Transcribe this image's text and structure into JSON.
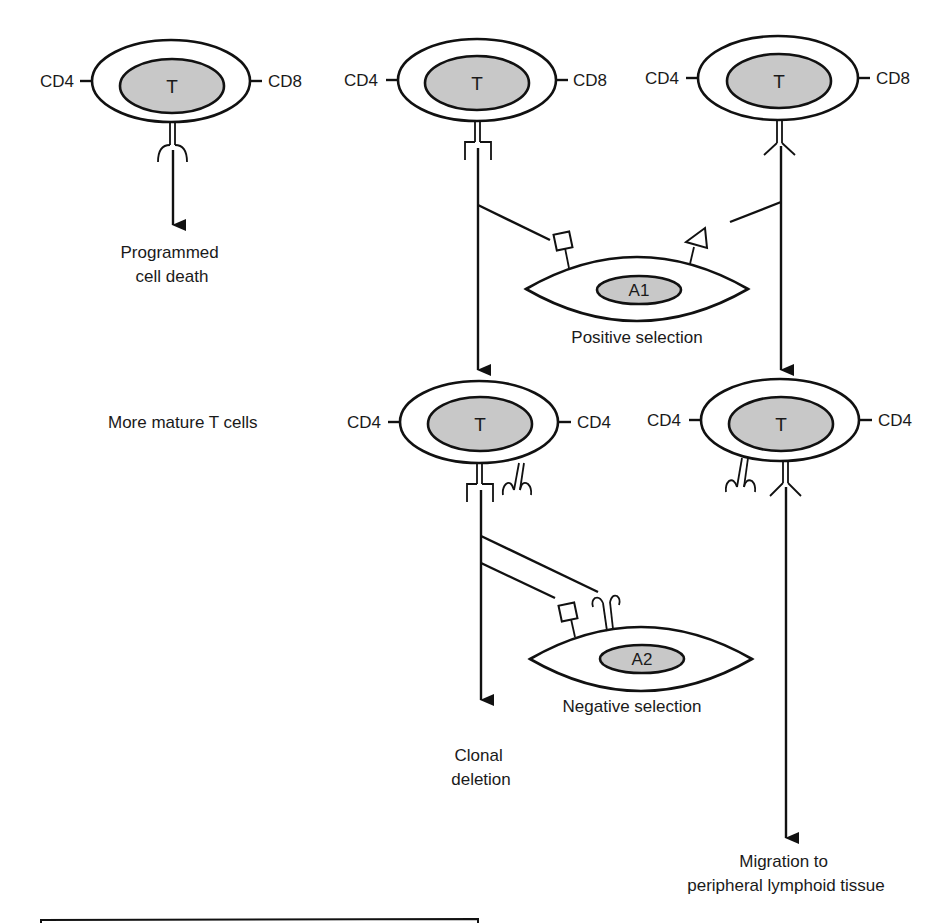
{
  "diagram": {
    "cells": {
      "immature_left": {
        "nucleus": "T",
        "marker_left": "CD4",
        "marker_right": "CD8",
        "fate": [
          "Programmed",
          "cell death"
        ]
      },
      "immature_middle": {
        "nucleus": "T",
        "marker_left": "CD4",
        "marker_right": "CD8"
      },
      "immature_right": {
        "nucleus": "T",
        "marker_left": "CD4",
        "marker_right": "CD8"
      },
      "mature_left": {
        "nucleus": "T",
        "marker_left": "CD4",
        "marker_right": "CD4",
        "fate": [
          "Clonal",
          "deletion"
        ]
      },
      "mature_right": {
        "nucleus": "T",
        "marker_left": "CD4",
        "marker_right": "CD4",
        "fate": [
          "Migration to",
          "peripheral lymphoid tissue"
        ]
      }
    },
    "antigen_cells": {
      "a1": {
        "nucleus": "A1",
        "label": "Positive selection"
      },
      "a2": {
        "nucleus": "A2",
        "label": "Negative selection"
      }
    },
    "row_label": "More mature T cells"
  }
}
